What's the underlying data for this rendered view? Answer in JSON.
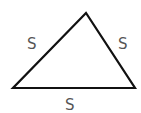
{
  "diagram": {
    "shape": "equilateral-triangle",
    "vertices": {
      "top": [
        86,
        13
      ],
      "left": [
        13,
        88
      ],
      "right": [
        135,
        88
      ]
    },
    "stroke_color": "#111111",
    "label_color": "#555555",
    "labels": {
      "left_side": "S",
      "right_side": "S",
      "base": "S"
    }
  }
}
